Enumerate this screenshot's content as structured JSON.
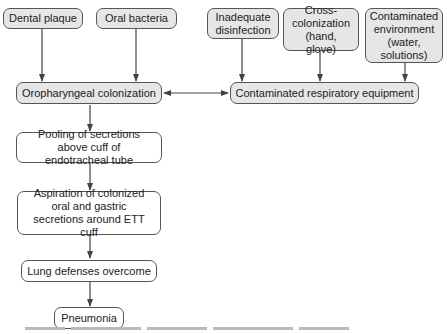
{
  "diagram": {
    "sources": [
      {
        "id": "dental-plaque",
        "label": "Dental plaque"
      },
      {
        "id": "oral-bacteria",
        "label": "Oral bacteria"
      },
      {
        "id": "inadequate-disinfection",
        "label": "Inadequate disinfection"
      },
      {
        "id": "cross-colonization",
        "label": "Cross-colonization (hand, glove)"
      },
      {
        "id": "contaminated-environment",
        "label": "Contaminated environment (water, solutions)"
      }
    ],
    "oropharyngeal": "Oropharyngeal colonization",
    "equipment": "Contaminated respiratory equipment",
    "chain": [
      {
        "id": "pooling",
        "label": "Pooling of secretions above cuff of endotracheal tube"
      },
      {
        "id": "aspiration",
        "label": "Aspiration of colonized oral and gastric secretions around ETT cuff"
      },
      {
        "id": "lung-defenses",
        "label": "Lung defenses overcome"
      },
      {
        "id": "pneumonia",
        "label": "Pneumonia"
      }
    ],
    "colors": {
      "gray_fill": "#e6e6e6",
      "border": "#555555",
      "arrow": "#444444"
    }
  }
}
